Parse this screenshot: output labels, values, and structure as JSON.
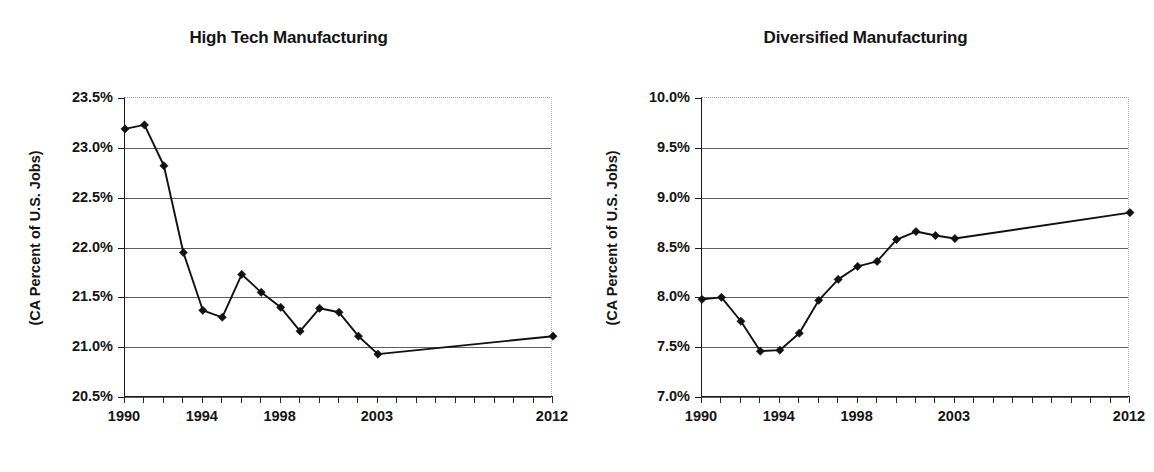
{
  "figure": {
    "axis_title": "(CA Percent of U.S. Jobs)",
    "x_tick_labels": [
      "1990",
      "1994",
      "1998",
      "2003",
      "2012"
    ],
    "x_tick_values": [
      1990,
      1994,
      1998,
      2003,
      2012
    ],
    "line_color": "#111111",
    "marker_color": "#111111",
    "grid_color": "#5f5f5f"
  },
  "chart_data": [
    {
      "type": "line",
      "title": "High Tech Manufacturing",
      "xlabel": "",
      "ylabel": "(CA Percent of U.S. Jobs)",
      "x": [
        1990,
        1991,
        1992,
        1993,
        1994,
        1995,
        1996,
        1997,
        1998,
        1999,
        2000,
        2001,
        2002,
        2003,
        2012
      ],
      "values": [
        23.19,
        23.23,
        22.82,
        21.95,
        21.37,
        21.3,
        21.73,
        21.55,
        21.4,
        21.16,
        21.39,
        21.35,
        21.11,
        20.93,
        21.11
      ],
      "xlim": [
        1990,
        2012
      ],
      "ylim": [
        20.5,
        23.5
      ],
      "y_tick_labels": [
        "20.5%",
        "21.0%",
        "21.5%",
        "22.0%",
        "22.5%",
        "23.0%",
        "23.5%"
      ],
      "y_tick_values": [
        20.5,
        21.0,
        21.5,
        22.0,
        22.5,
        23.0,
        23.5
      ],
      "grid": true,
      "legend": "none",
      "marker": "diamond"
    },
    {
      "type": "line",
      "title": "Diversified Manufacturing",
      "xlabel": "",
      "ylabel": "(CA Percent of U.S. Jobs)",
      "x": [
        1990,
        1991,
        1992,
        1993,
        1994,
        1995,
        1996,
        1997,
        1998,
        1999,
        2000,
        2001,
        2002,
        2003,
        2012
      ],
      "values": [
        7.98,
        8.0,
        7.76,
        7.46,
        7.47,
        7.64,
        7.97,
        8.18,
        8.31,
        8.36,
        8.58,
        8.66,
        8.62,
        8.59,
        8.85
      ],
      "xlim": [
        1990,
        2012
      ],
      "ylim": [
        7.0,
        10.0
      ],
      "y_tick_labels": [
        "7.0%",
        "7.5%",
        "8.0%",
        "8.5%",
        "9.0%",
        "9.5%",
        "10.0%"
      ],
      "y_tick_values": [
        7.0,
        7.5,
        8.0,
        8.5,
        9.0,
        9.5,
        10.0
      ],
      "grid": true,
      "legend": "none",
      "marker": "diamond"
    }
  ]
}
